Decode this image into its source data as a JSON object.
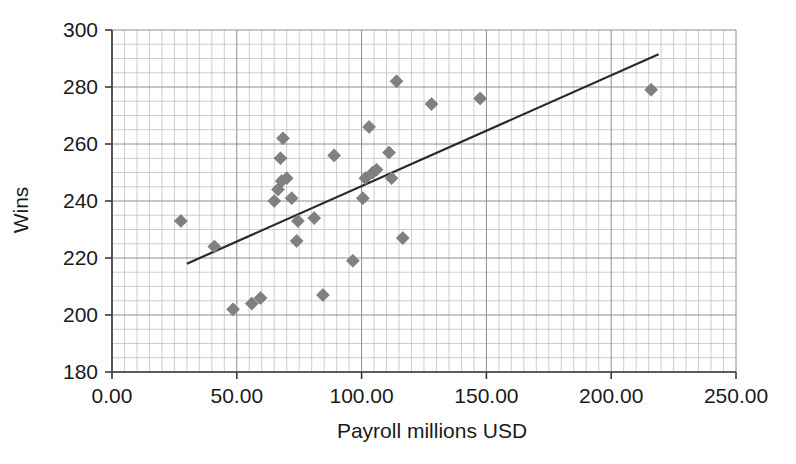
{
  "chart_data": {
    "type": "scatter",
    "title": "",
    "xlabel": "Payroll millions USD",
    "ylabel": "Wins",
    "xlim": [
      0,
      250
    ],
    "ylim": [
      180,
      300
    ],
    "x_tick_labels": [
      "0.00",
      "50.00",
      "100.00",
      "150.00",
      "200.00",
      "250.00"
    ],
    "x_tick_values": [
      0,
      50,
      100,
      150,
      200,
      250
    ],
    "y_tick_labels": [
      "180",
      "200",
      "220",
      "240",
      "260",
      "280",
      "300"
    ],
    "y_tick_values": [
      180,
      200,
      220,
      240,
      260,
      280,
      300
    ],
    "grid": true,
    "grid_minor_x_step": 5,
    "grid_minor_y_step": 5,
    "legend": "none",
    "marker": "diamond",
    "marker_color": "#808080",
    "line_color": "#2a2a2a",
    "points": [
      {
        "x": 27.6,
        "y": 233
      },
      {
        "x": 41.0,
        "y": 224
      },
      {
        "x": 48.5,
        "y": 202
      },
      {
        "x": 56.0,
        "y": 204
      },
      {
        "x": 59.5,
        "y": 206
      },
      {
        "x": 65.0,
        "y": 240
      },
      {
        "x": 66.5,
        "y": 244
      },
      {
        "x": 68.0,
        "y": 247
      },
      {
        "x": 70.0,
        "y": 248
      },
      {
        "x": 67.5,
        "y": 255
      },
      {
        "x": 68.5,
        "y": 262
      },
      {
        "x": 72.0,
        "y": 241
      },
      {
        "x": 74.0,
        "y": 226
      },
      {
        "x": 74.5,
        "y": 233
      },
      {
        "x": 81.0,
        "y": 234
      },
      {
        "x": 84.5,
        "y": 207
      },
      {
        "x": 89.0,
        "y": 256
      },
      {
        "x": 96.5,
        "y": 219
      },
      {
        "x": 100.5,
        "y": 241
      },
      {
        "x": 101.5,
        "y": 248
      },
      {
        "x": 103.0,
        "y": 266
      },
      {
        "x": 104.5,
        "y": 250
      },
      {
        "x": 106.0,
        "y": 251
      },
      {
        "x": 111.0,
        "y": 257
      },
      {
        "x": 112.0,
        "y": 248
      },
      {
        "x": 114.0,
        "y": 282
      },
      {
        "x": 116.5,
        "y": 227
      },
      {
        "x": 128.0,
        "y": 274
      },
      {
        "x": 147.5,
        "y": 276
      },
      {
        "x": 216.0,
        "y": 279
      }
    ],
    "trend_line": {
      "x_start": 30.0,
      "y_start": 218.0,
      "x_end": 219.0,
      "y_end": 291.5
    }
  }
}
